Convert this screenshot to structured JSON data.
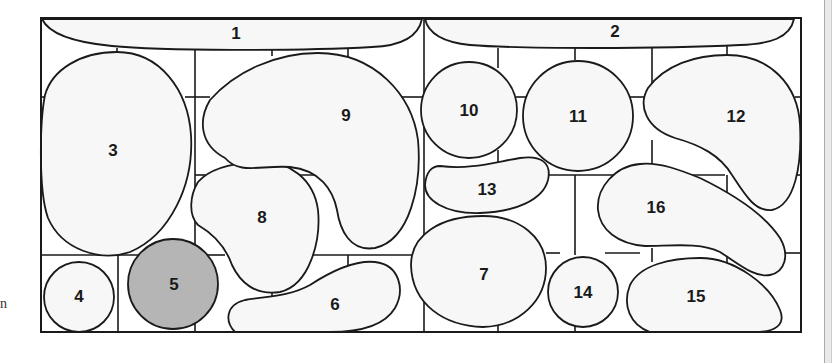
{
  "diagram": {
    "title": "",
    "highlighted_region": "5",
    "colors": {
      "stroke": "#1a1a1a",
      "shape_fill": "#f7f7f7",
      "highlight_fill": "#b5b5b5",
      "background": "#ffffff"
    },
    "regions": [
      {
        "id": "1",
        "label": "1"
      },
      {
        "id": "2",
        "label": "2"
      },
      {
        "id": "3",
        "label": "3"
      },
      {
        "id": "4",
        "label": "4"
      },
      {
        "id": "5",
        "label": "5"
      },
      {
        "id": "6",
        "label": "6"
      },
      {
        "id": "7",
        "label": "7"
      },
      {
        "id": "8",
        "label": "8"
      },
      {
        "id": "9",
        "label": "9"
      },
      {
        "id": "10",
        "label": "10"
      },
      {
        "id": "11",
        "label": "11"
      },
      {
        "id": "12",
        "label": "12"
      },
      {
        "id": "13",
        "label": "13"
      },
      {
        "id": "14",
        "label": "14"
      },
      {
        "id": "15",
        "label": "15"
      },
      {
        "id": "16",
        "label": "16"
      }
    ]
  },
  "margin_text": "n"
}
